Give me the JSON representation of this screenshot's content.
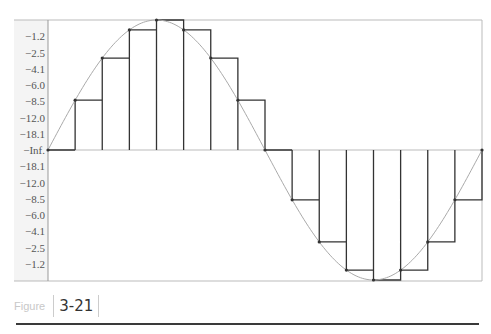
{
  "figure": {
    "label": "Figure",
    "number": "3-21"
  },
  "chart_data": {
    "type": "line",
    "title": "",
    "xlabel": "",
    "ylabel": "",
    "y_tick_labels_upper": [
      "-1.2",
      "-2.5",
      "-4.1",
      "-6.0",
      "-8.5",
      "-12.0",
      "-18.1",
      "-Inf."
    ],
    "y_tick_labels_lower": [
      "-18.1",
      "-12.0",
      "-8.5",
      "-6.0",
      "-4.1",
      "-2.5",
      "-1.2"
    ],
    "y_tick_values_linear": [
      0.875,
      0.75,
      0.625,
      0.5,
      0.375,
      0.25,
      0.125,
      0,
      -0.125,
      -0.25,
      -0.375,
      -0.5,
      -0.625,
      -0.75,
      -0.875
    ],
    "ylim": [
      -1,
      1
    ],
    "grid": false,
    "series": [
      {
        "name": "sine",
        "kind": "curve",
        "color": "#aaaaaa",
        "x": [
          0,
          1,
          2,
          3,
          4,
          5,
          6,
          7,
          8,
          9,
          10,
          11,
          12,
          13,
          14,
          15,
          16
        ],
        "values": [
          0,
          0.383,
          0.707,
          0.924,
          1,
          0.924,
          0.707,
          0.383,
          0,
          -0.383,
          -0.707,
          -0.924,
          -1,
          -0.924,
          -0.707,
          -0.383,
          0
        ]
      },
      {
        "name": "sample-and-hold",
        "kind": "step",
        "color": "#333333",
        "x": [
          0,
          1,
          2,
          3,
          4,
          5,
          6,
          7,
          8,
          9,
          10,
          11,
          12,
          13,
          14,
          15
        ],
        "values": [
          0,
          0.383,
          0.707,
          0.924,
          1,
          0.924,
          0.707,
          0.383,
          0,
          -0.383,
          -0.707,
          -0.924,
          -1,
          -0.924,
          -0.707,
          -0.383
        ]
      }
    ]
  },
  "colors": {
    "curve": "#aaaaaa",
    "steps": "#333333",
    "axis": "#999999",
    "frame": "#bbbbbb",
    "label_bg": "#f2f2f2"
  }
}
